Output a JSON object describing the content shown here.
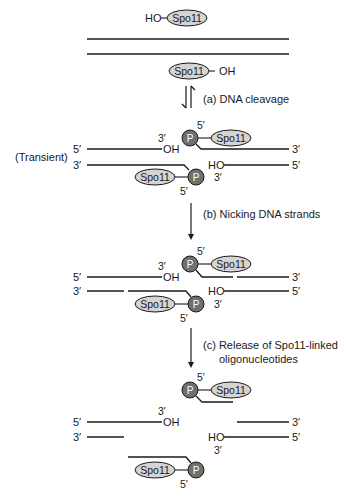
{
  "protein": "Spo11",
  "phosphate": "P",
  "labels": {
    "hydroxyl_left": "HO",
    "hydroxyl_right": "OH",
    "five_prime": "5′",
    "three_prime": "3′",
    "transient": "(Transient)"
  },
  "steps": [
    {
      "label": "(a) DNA cleavage",
      "arrow": "reversible"
    },
    {
      "label": "(b) Nicking DNA strands",
      "arrow": "forward"
    },
    {
      "label_line1": "(c) Release of Spo11-linked",
      "label_line2": "oligonucleotides",
      "arrow": "forward"
    }
  ],
  "colors": {
    "protein_fill": "#d4d4d4",
    "phosphate_fill": "#707070",
    "line": "#1a1a1a"
  }
}
